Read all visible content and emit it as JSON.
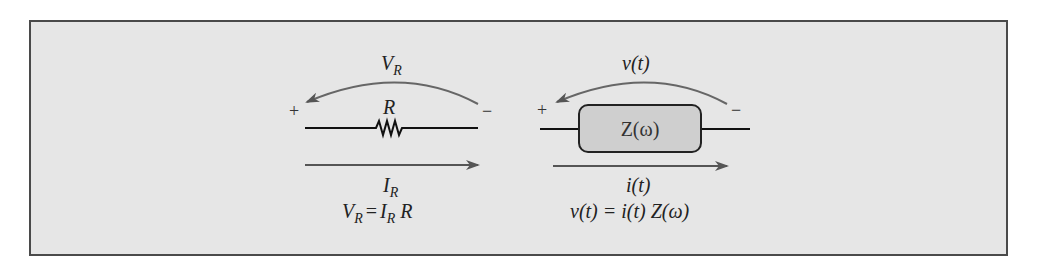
{
  "figure": {
    "background": "#e6e6e6",
    "border_color": "#4a4a4a",
    "resistor": {
      "voltage_label": "V",
      "voltage_sub": "R",
      "component_label": "R",
      "plus": "+",
      "minus": "−",
      "current_label": "I",
      "current_sub": "R",
      "equation": {
        "lhs": "V",
        "lhs_sub": "R",
        "eq": "=",
        "i": "I",
        "i_sub": "R",
        "r": "R"
      }
    },
    "impedance": {
      "voltage_label": "v(t)",
      "component_label": "Z(ω)",
      "plus": "+",
      "minus": "−",
      "current_label": "i(t)",
      "equation": "v(t) = i(t) Z(ω)",
      "box_fill": "#cfcfcf"
    }
  }
}
